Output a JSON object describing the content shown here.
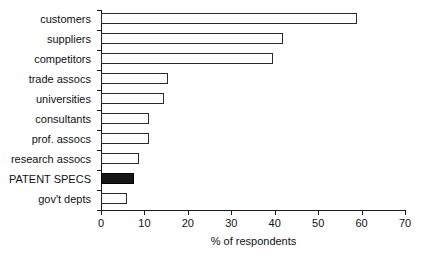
{
  "chart_data": {
    "type": "bar",
    "orientation": "horizontal",
    "title": "",
    "xlabel": "% of respondents",
    "ylabel": "",
    "xlim": [
      0,
      70
    ],
    "xticks": [
      0,
      10,
      20,
      30,
      40,
      50,
      60,
      70
    ],
    "grid": false,
    "legend": false,
    "categories": [
      "customers",
      "suppliers",
      "competitors",
      "trade assocs",
      "universities",
      "consultants",
      "prof. assocs",
      "research assocs",
      "PATENT SPECS",
      "gov't depts"
    ],
    "values": [
      59,
      42,
      39.5,
      15.5,
      14.5,
      11,
      11,
      8.7,
      7.5,
      6
    ],
    "highlight_category": "PATENT SPECS",
    "colors": {
      "bar_fill": "#ffffff",
      "bar_edge": "#2b2b2b",
      "highlight_fill": "#161616",
      "axis": "#1a1a1a",
      "text": "#111111",
      "background": "#ffffff"
    }
  }
}
